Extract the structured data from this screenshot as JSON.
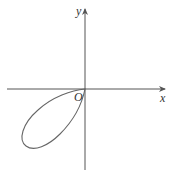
{
  "figure": {
    "type": "polar-curve-sketch",
    "axes": {
      "x_label": "x",
      "y_label": "y",
      "origin_label": "O"
    },
    "curve": {
      "description": "single closed teardrop loop in the third quadrant, passing through the origin",
      "color": "#555555"
    },
    "axis_color": "#555555"
  }
}
